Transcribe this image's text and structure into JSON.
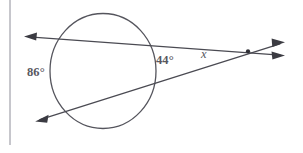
{
  "figure": {
    "kind": "geometry-diagram",
    "background_color": "#ffffff",
    "ink_color": "#4a4a52",
    "label_color": "#58585f",
    "circle": {
      "name": "circle",
      "center_x": 103,
      "center_y": 71,
      "radius": 57,
      "radius_x": 53,
      "radius_y": 57.5
    },
    "vertex": {
      "name": "external-intersection-point",
      "x": 248,
      "y": 51.5
    },
    "lines": [
      {
        "name": "upper-secant",
        "from_x": 25,
        "from_y": 36.5,
        "to_x": 284,
        "to_y": 55.5,
        "arrow_start": true,
        "arrow_end": true
      },
      {
        "name": "lower-secant",
        "from_x": 36,
        "from_y": 121,
        "to_x": 284,
        "to_y": 42.5,
        "arrow_start": true,
        "arrow_end": true
      }
    ],
    "margin_rule": {
      "name": "page-margin-rule",
      "x": 10,
      "y_top": 0,
      "y_bottom": 145,
      "color": "#8e8e99"
    },
    "labels": {
      "far_arc": "86°",
      "near_arc": "44°",
      "unknown_angle": "x"
    }
  }
}
